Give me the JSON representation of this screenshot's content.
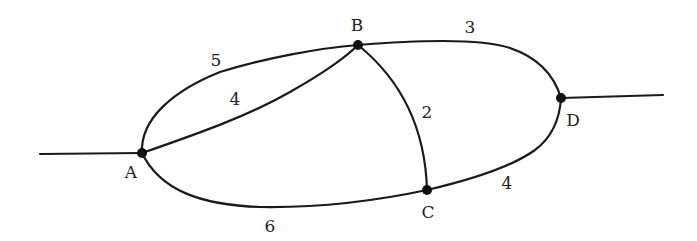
{
  "diagram": {
    "type": "weighted-graph",
    "nodes": [
      {
        "id": "A",
        "label": "A",
        "x": 142,
        "y": 153,
        "lx": 131,
        "ly": 178
      },
      {
        "id": "B",
        "label": "B",
        "x": 358,
        "y": 45,
        "lx": 357,
        "ly": 31
      },
      {
        "id": "C",
        "label": "C",
        "x": 427,
        "y": 190,
        "lx": 428,
        "ly": 218
      },
      {
        "id": "D",
        "label": "D",
        "x": 561,
        "y": 98,
        "lx": 573,
        "ly": 126
      }
    ],
    "edges": [
      {
        "id": "AB-outer",
        "from": "A",
        "to": "B",
        "weight": "5",
        "lx": 216,
        "ly": 66
      },
      {
        "id": "AB-inner",
        "from": "A",
        "to": "B",
        "weight": "4",
        "lx": 235,
        "ly": 105
      },
      {
        "id": "BD",
        "from": "B",
        "to": "D",
        "weight": "3",
        "lx": 470,
        "ly": 33
      },
      {
        "id": "BC",
        "from": "B",
        "to": "C",
        "weight": "2",
        "lx": 427,
        "ly": 118
      },
      {
        "id": "CD",
        "from": "C",
        "to": "D",
        "weight": "4",
        "lx": 507,
        "ly": 189
      },
      {
        "id": "AC",
        "from": "A",
        "to": "C",
        "weight": "6",
        "lx": 270,
        "ly": 232
      }
    ],
    "stubs": [
      {
        "id": "left-stub",
        "attached_to": "A"
      },
      {
        "id": "right-stub",
        "attached_to": "D"
      }
    ]
  }
}
